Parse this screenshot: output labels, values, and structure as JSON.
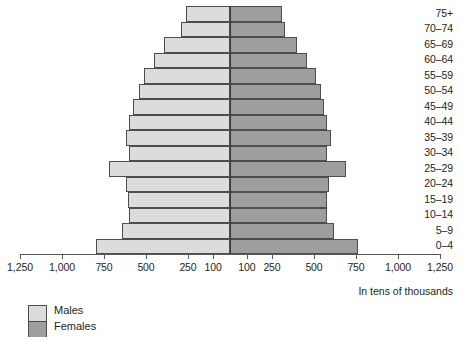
{
  "chart_data": {
    "type": "bar",
    "subtype": "population-pyramid",
    "title": "",
    "xlabel": "",
    "ylabel": "",
    "units_note": "In tens of thousands",
    "grid": false,
    "legend_position": "bottom-left",
    "axis": {
      "center_value": 100,
      "max": 1250,
      "tick_values_left": [
        1250,
        1000,
        750,
        500,
        250,
        100
      ],
      "tick_values_right": [
        100,
        250,
        500,
        750,
        1000,
        1250
      ],
      "tick_labels_left": [
        "1,250",
        "1,000",
        "750",
        "500",
        "250",
        "100"
      ],
      "tick_labels_right": [
        "100",
        "250",
        "500",
        "750",
        "1,000",
        "1,250"
      ]
    },
    "categories": [
      "75+",
      "70–74",
      "65–69",
      "60–64",
      "55–59",
      "50–54",
      "45–49",
      "40–44",
      "35–39",
      "30–34",
      "25–29",
      "20–24",
      "15–19",
      "10–14",
      "5–9",
      "0–4"
    ],
    "series": [
      {
        "name": "Males",
        "color": "#dcdcdc",
        "values": [
          260,
          290,
          390,
          450,
          510,
          540,
          580,
          600,
          620,
          600,
          720,
          620,
          610,
          600,
          640,
          800
        ]
      },
      {
        "name": "Females",
        "color": "#9e9e9e",
        "values": [
          310,
          330,
          400,
          460,
          510,
          540,
          560,
          580,
          600,
          580,
          690,
          590,
          580,
          580,
          620,
          760
        ]
      }
    ]
  },
  "legend": {
    "items": [
      {
        "label": "Males",
        "color": "#dcdcdc"
      },
      {
        "label": "Females",
        "color": "#9e9e9e"
      }
    ]
  }
}
